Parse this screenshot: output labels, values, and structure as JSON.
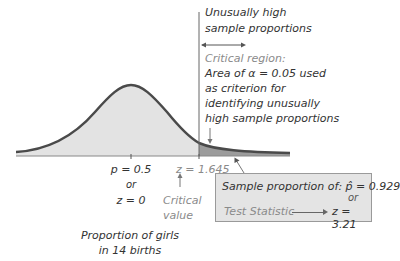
{
  "diagram": {
    "type": "normal-distribution-critical-region",
    "colors": {
      "curve": "#4a4a4a",
      "fill": "#e3e3e3",
      "critical_fill": "#9c9c9c",
      "box_fill": "#e4e4e4",
      "gray_text": "#8a8a8a"
    }
  },
  "region_label": {
    "line1": "Unusually high",
    "line2": "sample proportions"
  },
  "critical_region": {
    "title": "Critical region:",
    "line1": "Area of α = 0.05 used",
    "line2": "as criterion for",
    "line3": "identifying unusually",
    "line4": "high sample proportions"
  },
  "axis": {
    "center_p": "p = 0.5",
    "center_or": "or",
    "center_z": "z = 0",
    "critical_z": "z = 1.645",
    "critical_label_1": "Critical",
    "critical_label_2": "value",
    "xlabel_1": "Proportion of girls",
    "xlabel_2": "in 14 births"
  },
  "result_box": {
    "sample_label": "Sample proportion of: p̂ = 0.929",
    "or": "or",
    "test_label": "Test Statistic",
    "test_value": "z = 3.21"
  }
}
